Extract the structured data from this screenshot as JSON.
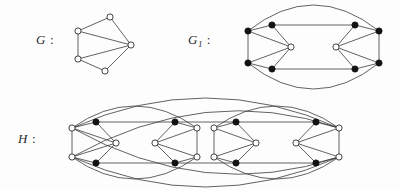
{
  "figure": {
    "background_color": "#fdfdfd",
    "stroke_color": "#3a3a3a",
    "node_open_fill": "#ffffff",
    "node_filled_fill": "#121212"
  },
  "labels": {
    "g": {
      "name": "G",
      "subscript": "",
      "colon": ":"
    },
    "g1": {
      "name": "G",
      "subscript": "1",
      "colon": ":"
    },
    "h": {
      "name": "H",
      "subscript": "",
      "colon": ":"
    }
  },
  "graphs": [
    {
      "id": "G",
      "label": "G",
      "description": "five-vertex graph, all vertices open circles",
      "node_radius": 3.1,
      "nodes": [
        {
          "id": "g-top",
          "x": 110,
          "y": 17,
          "style": "open"
        },
        {
          "id": "g-upper-left",
          "x": 78,
          "y": 31,
          "style": "open"
        },
        {
          "id": "g-lower-left",
          "x": 78,
          "y": 59,
          "style": "open"
        },
        {
          "id": "g-bottom",
          "x": 105,
          "y": 71,
          "style": "open"
        },
        {
          "id": "g-right",
          "x": 131,
          "y": 45,
          "style": "open"
        }
      ],
      "edges": [
        [
          "g-top",
          "g-upper-left"
        ],
        [
          "g-top",
          "g-right"
        ],
        [
          "g-upper-left",
          "g-lower-left"
        ],
        [
          "g-upper-left",
          "g-right"
        ],
        [
          "g-lower-left",
          "g-bottom"
        ],
        [
          "g-lower-left",
          "g-right"
        ],
        [
          "g-bottom",
          "g-right"
        ]
      ],
      "arcs": []
    },
    {
      "id": "G1",
      "label": "G1",
      "description": "ten-vertex mirror-symmetric graph; eight filled vertices and two open centre vertices, enclosed by two long outer arcs",
      "node_radius": 3.1,
      "nodes": [
        {
          "id": "g1-l-outer-top",
          "x": 248,
          "y": 31,
          "style": "filled"
        },
        {
          "id": "g1-l-outer-bottom",
          "x": 248,
          "y": 63,
          "style": "filled"
        },
        {
          "id": "g1-l-inner-top",
          "x": 272,
          "y": 25,
          "style": "filled"
        },
        {
          "id": "g1-l-inner-bottom",
          "x": 272,
          "y": 69,
          "style": "filled"
        },
        {
          "id": "g1-l-centre",
          "x": 291,
          "y": 47,
          "style": "open"
        },
        {
          "id": "g1-r-centre",
          "x": 336,
          "y": 47,
          "style": "open"
        },
        {
          "id": "g1-r-inner-top",
          "x": 355,
          "y": 25,
          "style": "filled"
        },
        {
          "id": "g1-r-inner-bottom",
          "x": 355,
          "y": 69,
          "style": "filled"
        },
        {
          "id": "g1-r-outer-top",
          "x": 379,
          "y": 31,
          "style": "filled"
        },
        {
          "id": "g1-r-outer-bottom",
          "x": 379,
          "y": 63,
          "style": "filled"
        }
      ],
      "edges": [
        [
          "g1-l-outer-top",
          "g1-l-outer-bottom"
        ],
        [
          "g1-l-outer-top",
          "g1-l-inner-top"
        ],
        [
          "g1-l-outer-top",
          "g1-l-centre"
        ],
        [
          "g1-l-outer-bottom",
          "g1-l-inner-bottom"
        ],
        [
          "g1-l-outer-bottom",
          "g1-l-centre"
        ],
        [
          "g1-l-inner-top",
          "g1-l-centre"
        ],
        [
          "g1-l-inner-bottom",
          "g1-l-centre"
        ],
        [
          "g1-r-outer-top",
          "g1-r-outer-bottom"
        ],
        [
          "g1-r-outer-top",
          "g1-r-inner-top"
        ],
        [
          "g1-r-outer-top",
          "g1-r-centre"
        ],
        [
          "g1-r-outer-bottom",
          "g1-r-inner-bottom"
        ],
        [
          "g1-r-outer-bottom",
          "g1-r-centre"
        ],
        [
          "g1-r-inner-top",
          "g1-r-centre"
        ],
        [
          "g1-r-inner-bottom",
          "g1-r-centre"
        ],
        [
          "g1-l-inner-top",
          "g1-r-inner-top"
        ],
        [
          "g1-l-inner-bottom",
          "g1-r-inner-bottom"
        ]
      ],
      "arcs": [
        {
          "from": "g1-l-outer-top",
          "to": "g1-r-outer-top",
          "bow": -26
        },
        {
          "from": "g1-l-outer-bottom",
          "to": "g1-r-outer-bottom",
          "bow": 26
        }
      ]
    },
    {
      "id": "H",
      "label": "H",
      "description": "twenty-vertex graph formed from two G1-like blocks joined by long horizontal edges and two pairs of large crossing outer arcs",
      "node_radius": 3.1,
      "nodes": [
        {
          "id": "h-a-outer-top",
          "x": 72,
          "y": 128,
          "style": "open"
        },
        {
          "id": "h-a-outer-bottom",
          "x": 72,
          "y": 157,
          "style": "open"
        },
        {
          "id": "h-a-inner-top",
          "x": 96,
          "y": 122,
          "style": "filled"
        },
        {
          "id": "h-a-inner-bottom",
          "x": 96,
          "y": 163,
          "style": "filled"
        },
        {
          "id": "h-a-centre",
          "x": 116,
          "y": 143,
          "style": "open"
        },
        {
          "id": "h-b-centre",
          "x": 155,
          "y": 143,
          "style": "open"
        },
        {
          "id": "h-b-inner-top",
          "x": 175,
          "y": 122,
          "style": "filled"
        },
        {
          "id": "h-b-inner-bottom",
          "x": 175,
          "y": 163,
          "style": "filled"
        },
        {
          "id": "h-b-outer-top",
          "x": 197,
          "y": 128,
          "style": "open"
        },
        {
          "id": "h-b-outer-bottom",
          "x": 197,
          "y": 157,
          "style": "open"
        },
        {
          "id": "h-c-outer-top",
          "x": 214,
          "y": 128,
          "style": "open"
        },
        {
          "id": "h-c-outer-bottom",
          "x": 214,
          "y": 157,
          "style": "open"
        },
        {
          "id": "h-c-inner-top",
          "x": 236,
          "y": 122,
          "style": "filled"
        },
        {
          "id": "h-c-inner-bottom",
          "x": 236,
          "y": 163,
          "style": "filled"
        },
        {
          "id": "h-c-centre",
          "x": 256,
          "y": 143,
          "style": "open"
        },
        {
          "id": "h-d-centre",
          "x": 296,
          "y": 143,
          "style": "open"
        },
        {
          "id": "h-d-inner-top",
          "x": 316,
          "y": 122,
          "style": "filled"
        },
        {
          "id": "h-d-inner-bottom",
          "x": 316,
          "y": 163,
          "style": "filled"
        },
        {
          "id": "h-d-outer-top",
          "x": 339,
          "y": 128,
          "style": "open"
        },
        {
          "id": "h-d-outer-bottom",
          "x": 339,
          "y": 157,
          "style": "open"
        }
      ],
      "edges": [
        [
          "h-a-outer-top",
          "h-a-outer-bottom"
        ],
        [
          "h-a-outer-top",
          "h-a-inner-top"
        ],
        [
          "h-a-outer-top",
          "h-a-centre"
        ],
        [
          "h-a-outer-bottom",
          "h-a-inner-bottom"
        ],
        [
          "h-a-outer-bottom",
          "h-a-centre"
        ],
        [
          "h-a-inner-top",
          "h-a-centre"
        ],
        [
          "h-a-inner-bottom",
          "h-a-centre"
        ],
        [
          "h-b-outer-top",
          "h-b-outer-bottom"
        ],
        [
          "h-b-outer-top",
          "h-b-inner-top"
        ],
        [
          "h-b-outer-top",
          "h-b-centre"
        ],
        [
          "h-b-outer-bottom",
          "h-b-inner-bottom"
        ],
        [
          "h-b-outer-bottom",
          "h-b-centre"
        ],
        [
          "h-b-inner-top",
          "h-b-centre"
        ],
        [
          "h-b-inner-bottom",
          "h-b-centre"
        ],
        [
          "h-a-inner-top",
          "h-b-inner-top"
        ],
        [
          "h-a-inner-bottom",
          "h-b-inner-bottom"
        ],
        [
          "h-c-outer-top",
          "h-c-outer-bottom"
        ],
        [
          "h-c-outer-top",
          "h-c-inner-top"
        ],
        [
          "h-c-outer-top",
          "h-c-centre"
        ],
        [
          "h-c-outer-bottom",
          "h-c-inner-bottom"
        ],
        [
          "h-c-outer-bottom",
          "h-c-centre"
        ],
        [
          "h-c-inner-top",
          "h-c-centre"
        ],
        [
          "h-c-inner-bottom",
          "h-c-centre"
        ],
        [
          "h-d-outer-top",
          "h-d-outer-bottom"
        ],
        [
          "h-d-outer-top",
          "h-d-inner-top"
        ],
        [
          "h-d-outer-top",
          "h-d-centre"
        ],
        [
          "h-d-outer-bottom",
          "h-d-inner-bottom"
        ],
        [
          "h-d-outer-bottom",
          "h-d-centre"
        ],
        [
          "h-d-inner-top",
          "h-d-centre"
        ],
        [
          "h-d-inner-bottom",
          "h-d-centre"
        ],
        [
          "h-c-inner-top",
          "h-d-inner-top"
        ],
        [
          "h-c-inner-bottom",
          "h-d-inner-bottom"
        ],
        [
          "h-b-inner-top",
          "h-c-inner-top"
        ],
        [
          "h-b-inner-bottom",
          "h-c-inner-bottom"
        ]
      ],
      "arcs": [
        {
          "from": "h-a-outer-top",
          "to": "h-b-outer-top",
          "bow": -22
        },
        {
          "from": "h-a-outer-bottom",
          "to": "h-b-outer-bottom",
          "bow": 22
        },
        {
          "from": "h-c-outer-top",
          "to": "h-d-outer-top",
          "bow": -22
        },
        {
          "from": "h-c-outer-bottom",
          "to": "h-d-outer-bottom",
          "bow": 22
        },
        {
          "from": "h-a-outer-top",
          "to": "h-d-outer-top",
          "bow": -30
        },
        {
          "from": "h-a-outer-bottom",
          "to": "h-d-outer-bottom",
          "bow": 30
        },
        {
          "from": "h-a-outer-top",
          "to": "h-d-outer-bottom",
          "bow": 30
        },
        {
          "from": "h-a-outer-bottom",
          "to": "h-d-outer-top",
          "bow": -30
        }
      ]
    }
  ]
}
